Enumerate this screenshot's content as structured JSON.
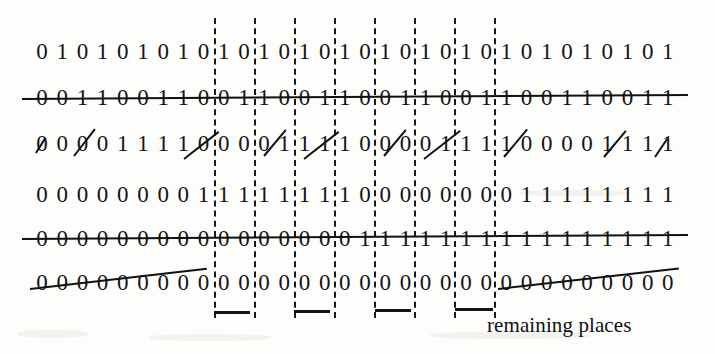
{
  "figure": {
    "caption": "remaining places",
    "ink_color": "#141414",
    "paper_color": "#fdfdfb",
    "columns": 32,
    "rows": [
      {
        "id": "row-1",
        "bits": [
          "0",
          "1",
          "0",
          "1",
          "0",
          "1",
          "0",
          "1",
          "0",
          "1",
          "0",
          "1",
          "0",
          "1",
          "0",
          "1",
          "0",
          "1",
          "0",
          "1",
          "0",
          "1",
          "0",
          "1",
          "0",
          "1",
          "0",
          "1",
          "0",
          "1",
          "0",
          "1"
        ],
        "struck": "none"
      },
      {
        "id": "row-2",
        "bits": [
          "0",
          "0",
          "1",
          "1",
          "0",
          "0",
          "1",
          "1",
          "0",
          "0",
          "1",
          "1",
          "0",
          "0",
          "1",
          "1",
          "0",
          "0",
          "1",
          "1",
          "0",
          "0",
          "1",
          "1",
          "0",
          "0",
          "1",
          "1",
          "0",
          "0",
          "1",
          "1"
        ],
        "struck": "full-horizontal"
      },
      {
        "id": "row-3",
        "bits": [
          "0",
          "0",
          "0",
          "0",
          "1",
          "1",
          "1",
          "1",
          "0",
          "0",
          "0",
          "0",
          "1",
          "1",
          "1",
          "1",
          "0",
          "0",
          "0",
          "0",
          "1",
          "1",
          "1",
          "1",
          "0",
          "0",
          "0",
          "0",
          "1",
          "1",
          "1",
          "1"
        ],
        "struck": "diagonal-segments"
      },
      {
        "id": "row-4",
        "bits": [
          "0",
          "0",
          "0",
          "0",
          "0",
          "0",
          "0",
          "0",
          "1",
          "1",
          "1",
          "1",
          "1",
          "1",
          "1",
          "1",
          "0",
          "0",
          "0",
          "0",
          "0",
          "0",
          "0",
          "0",
          "1",
          "1",
          "1",
          "1",
          "1",
          "1",
          "1",
          "1"
        ],
        "struck": "none"
      },
      {
        "id": "row-5",
        "bits": [
          "0",
          "0",
          "0",
          "0",
          "0",
          "0",
          "0",
          "0",
          "0",
          "0",
          "0",
          "0",
          "0",
          "0",
          "0",
          "0",
          "1",
          "1",
          "1",
          "1",
          "1",
          "1",
          "1",
          "1",
          "1",
          "1",
          "1",
          "1",
          "1",
          "1",
          "1",
          "1"
        ],
        "struck": "full-horizontal"
      },
      {
        "id": "row-6",
        "bits": [
          "0",
          "0",
          "0",
          "0",
          "0",
          "0",
          "0",
          "0",
          "0",
          "0",
          "0",
          "0",
          "0",
          "0",
          "0",
          "0",
          "0",
          "0",
          "0",
          "0",
          "0",
          "0",
          "0",
          "0",
          "0",
          "0",
          "0",
          "0",
          "0",
          "0",
          "0",
          "0"
        ],
        "struck": "diagonal-ends"
      }
    ],
    "guides": {
      "count": 8,
      "note": "dashed vertical separators between bit groups"
    },
    "tickmarks": {
      "count": 4,
      "note": "short underline marks below the last row"
    }
  }
}
